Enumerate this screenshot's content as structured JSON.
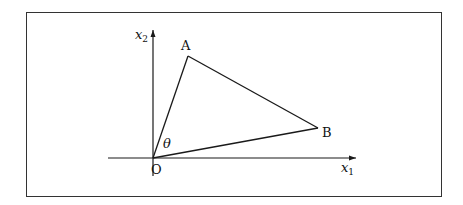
{
  "diagram": {
    "type": "vector-triangle",
    "axes": {
      "x_label": "x",
      "x_sub": "1",
      "y_label": "x",
      "y_sub": "2",
      "origin_label": "O"
    },
    "points": {
      "A": {
        "label": "A"
      },
      "B": {
        "label": "B"
      }
    },
    "angle_label": "θ",
    "stroke_color": "#1a1a1a"
  }
}
